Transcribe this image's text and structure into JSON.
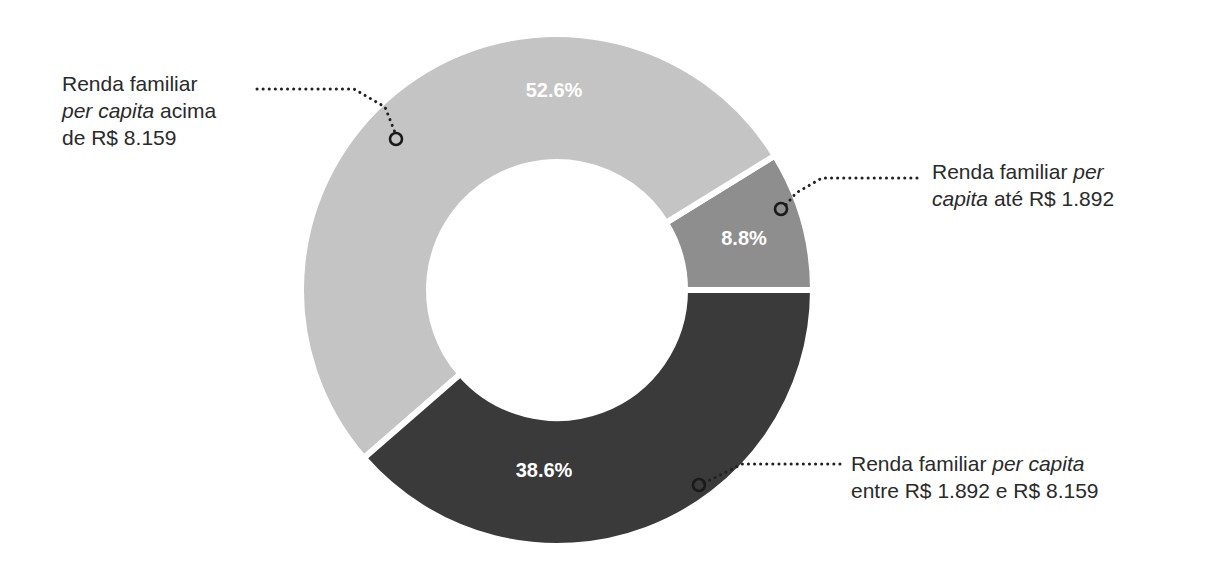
{
  "chart_data": {
    "type": "pie",
    "subtype": "donut",
    "title": "",
    "start_angle_deg": 0,
    "direction": "counter-clockwise",
    "slices": [
      {
        "id": "ate",
        "label": "Renda familiar per capita até R$ 1.892",
        "value": 8.8,
        "display": "8.8%",
        "color": "#8e8e8e"
      },
      {
        "id": "acima",
        "label": "Renda familiar per capita acima de R$ 8.159",
        "value": 52.6,
        "display": "52.6%",
        "color": "#c4c4c4"
      },
      {
        "id": "entre",
        "label": "Renda familiar per capita entre R$ 1.892 e R$ 8.159",
        "value": 38.6,
        "display": "38.6%",
        "color": "#3a3a3a"
      }
    ]
  },
  "annotations": {
    "acima": {
      "line1": "Renda familiar",
      "line2_italic": "per capita",
      "line2_rest": " acima",
      "line3": "de R$ 8.159"
    },
    "ate": {
      "line1_plain": "Renda familiar ",
      "line1_italic": "per",
      "line2_italic": "capita",
      "line2_rest": " até R$ 1.892"
    },
    "entre": {
      "line1_plain": "Renda familiar ",
      "line1_italic": "per capita",
      "line2": "entre R$ 1.892 e R$ 8.159"
    }
  }
}
